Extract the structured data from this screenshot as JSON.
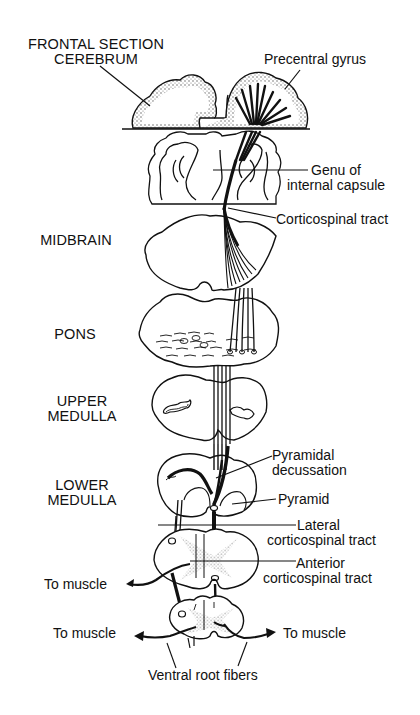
{
  "diagram": {
    "type": "anatomical-pathway",
    "colors": {
      "background": "#ffffff",
      "ink": "#111111",
      "stipple": "#777777"
    }
  },
  "levels": [
    {
      "id": "cerebrum",
      "lines": [
        "FRONTAL SECTION",
        "CEREBRUM"
      ]
    },
    {
      "id": "midbrain",
      "lines": [
        "MIDBRAIN"
      ]
    },
    {
      "id": "pons",
      "lines": [
        "PONS"
      ]
    },
    {
      "id": "upper-medulla",
      "lines": [
        "UPPER",
        "MEDULLA"
      ]
    },
    {
      "id": "lower-medulla",
      "lines": [
        "LOWER",
        "MEDULLA"
      ]
    }
  ],
  "annotations": {
    "precentral_gyrus": [
      "Precentral gyrus"
    ],
    "genu": [
      "Genu of",
      "internal capsule"
    ],
    "corticospinal_tract": [
      "Corticospinal tract"
    ],
    "pyramidal_decussation": [
      "Pyramidal",
      "decussation"
    ],
    "pyramid": [
      "Pyramid"
    ],
    "lateral_tract": [
      "Lateral",
      "corticospinal tract"
    ],
    "anterior_tract": [
      "Anterior",
      "corticospinal tract"
    ],
    "to_muscle_upper_left": "To muscle",
    "to_muscle_lower_left": "To muscle",
    "to_muscle_lower_right": "To muscle",
    "ventral_root_fibers": "Ventral root fibers"
  }
}
